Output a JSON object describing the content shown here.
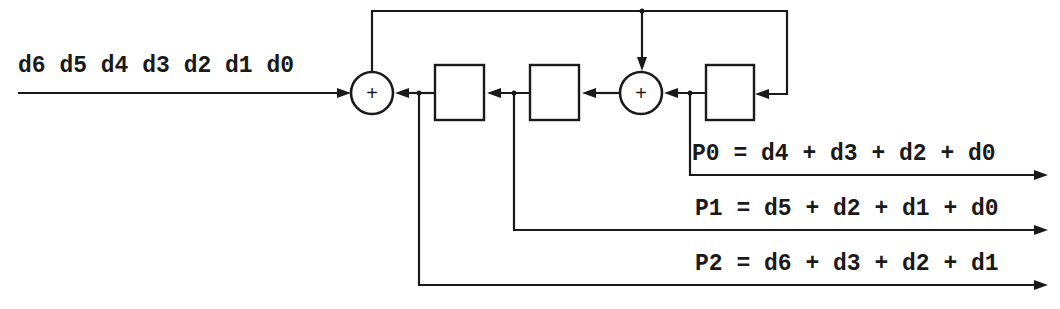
{
  "diagram": {
    "input_label": "d6 d5 d4 d3 d2 d1 d0",
    "adder_symbol": "+",
    "registers": [
      {
        "id": "register-1",
        "label": ""
      },
      {
        "id": "register-2",
        "label": ""
      },
      {
        "id": "register-3",
        "label": ""
      }
    ],
    "outputs": [
      {
        "name": "P0",
        "equation": "P0 = d4 + d3 + d2 + d0"
      },
      {
        "name": "P1",
        "equation": "P1 = d5 + d2 + d1 + d0"
      },
      {
        "name": "P2",
        "equation": "P2 = d6 + d3 + d2 + d1"
      }
    ],
    "colors": {
      "line": "#1a1a1a",
      "background": "#ffffff"
    }
  }
}
